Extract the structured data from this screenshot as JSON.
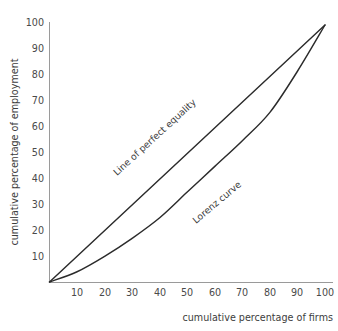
{
  "chart_data": {
    "type": "line",
    "title": "",
    "xlabel": "cumulative percentage of firms",
    "ylabel": "cumulative percentage of employment",
    "xlim": [
      0,
      100
    ],
    "ylim": [
      0,
      100
    ],
    "grid": false,
    "legend_position": "inline-annotation",
    "xticks": [
      "10",
      "20",
      "30",
      "40",
      "50",
      "60",
      "70",
      "80",
      "90",
      "100"
    ],
    "yticks": [
      "10",
      "20",
      "30",
      "40",
      "50",
      "60",
      "70",
      "80",
      "90",
      "100"
    ],
    "x": [
      0,
      10,
      20,
      30,
      40,
      50,
      60,
      70,
      80,
      90,
      100
    ],
    "series": [
      {
        "name": "Line of perfect equality",
        "values": [
          0,
          10,
          20,
          30,
          40,
          50,
          60,
          70,
          80,
          90,
          100
        ]
      },
      {
        "name": "Lorenz curve",
        "values": [
          0,
          4,
          10,
          17,
          25,
          35,
          45,
          55,
          66,
          82,
          100
        ]
      }
    ],
    "annotations": [
      {
        "text": "Line of perfect equality",
        "x": 38,
        "y": 46
      },
      {
        "text": "Lorenz curve",
        "x": 60,
        "y": 38
      }
    ],
    "colors": {
      "curve": "#2b2b2b",
      "axis": "#9a9a9a",
      "text": "#3d3d3d",
      "background": "#ffffff"
    }
  }
}
